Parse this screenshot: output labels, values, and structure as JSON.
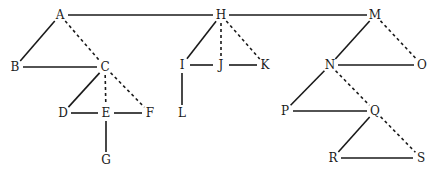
{
  "diagram": {
    "type": "tree-graph",
    "nodes": [
      {
        "id": "A",
        "label": "A",
        "x": 60,
        "y": 15
      },
      {
        "id": "B",
        "label": "B",
        "x": 15,
        "y": 67
      },
      {
        "id": "C",
        "label": "C",
        "x": 105,
        "y": 67
      },
      {
        "id": "D",
        "label": "D",
        "x": 63,
        "y": 113
      },
      {
        "id": "E",
        "label": "E",
        "x": 106,
        "y": 113
      },
      {
        "id": "F",
        "label": "F",
        "x": 150,
        "y": 113
      },
      {
        "id": "G",
        "label": "G",
        "x": 106,
        "y": 160
      },
      {
        "id": "H",
        "label": "H",
        "x": 221,
        "y": 15
      },
      {
        "id": "I",
        "label": "I",
        "x": 182,
        "y": 65
      },
      {
        "id": "J",
        "label": "J",
        "x": 221,
        "y": 65
      },
      {
        "id": "K",
        "label": "K",
        "x": 265,
        "y": 65
      },
      {
        "id": "L",
        "label": "L",
        "x": 182,
        "y": 113
      },
      {
        "id": "M",
        "label": "M",
        "x": 375,
        "y": 15
      },
      {
        "id": "N",
        "label": "N",
        "x": 330,
        "y": 65
      },
      {
        "id": "O",
        "label": "O",
        "x": 422,
        "y": 65
      },
      {
        "id": "P",
        "label": "P",
        "x": 285,
        "y": 111
      },
      {
        "id": "Q",
        "label": "Q",
        "x": 375,
        "y": 111
      },
      {
        "id": "R",
        "label": "R",
        "x": 333,
        "y": 158
      },
      {
        "id": "S",
        "label": "S",
        "x": 421,
        "y": 158
      }
    ],
    "edges": [
      {
        "from": "A",
        "to": "H",
        "style": "solid"
      },
      {
        "from": "H",
        "to": "M",
        "style": "solid"
      },
      {
        "from": "A",
        "to": "B",
        "style": "solid"
      },
      {
        "from": "A",
        "to": "C",
        "style": "dashed"
      },
      {
        "from": "B",
        "to": "C",
        "style": "solid"
      },
      {
        "from": "C",
        "to": "D",
        "style": "solid"
      },
      {
        "from": "C",
        "to": "E",
        "style": "dashed"
      },
      {
        "from": "C",
        "to": "F",
        "style": "dashed"
      },
      {
        "from": "D",
        "to": "E",
        "style": "solid"
      },
      {
        "from": "E",
        "to": "F",
        "style": "solid"
      },
      {
        "from": "E",
        "to": "G",
        "style": "solid"
      },
      {
        "from": "H",
        "to": "I",
        "style": "solid"
      },
      {
        "from": "H",
        "to": "J",
        "style": "dashed"
      },
      {
        "from": "H",
        "to": "K",
        "style": "dashed"
      },
      {
        "from": "I",
        "to": "J",
        "style": "solid"
      },
      {
        "from": "J",
        "to": "K",
        "style": "solid"
      },
      {
        "from": "I",
        "to": "L",
        "style": "solid"
      },
      {
        "from": "M",
        "to": "N",
        "style": "solid"
      },
      {
        "from": "M",
        "to": "O",
        "style": "dashed"
      },
      {
        "from": "N",
        "to": "O",
        "style": "solid"
      },
      {
        "from": "N",
        "to": "P",
        "style": "solid"
      },
      {
        "from": "N",
        "to": "Q",
        "style": "dashed"
      },
      {
        "from": "P",
        "to": "Q",
        "style": "solid"
      },
      {
        "from": "Q",
        "to": "R",
        "style": "solid"
      },
      {
        "from": "Q",
        "to": "S",
        "style": "dashed"
      },
      {
        "from": "R",
        "to": "S",
        "style": "solid"
      }
    ]
  }
}
